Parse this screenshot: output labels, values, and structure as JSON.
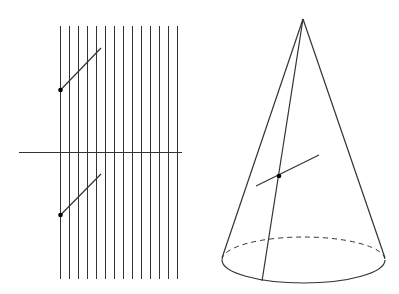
{
  "diagram": {
    "type": "geometry-figure",
    "stroke_color": "#333333",
    "dot_color": "#000000",
    "left_figure": {
      "description": "family of parallel vertical lines crossed by a horizontal line, with two tangent segments marked by points",
      "vertical_lines": {
        "count": 14,
        "x_start": 60,
        "spacing": 9,
        "y_top": 26,
        "y_bottom": 279
      },
      "horizontal_line": {
        "x1": 19,
        "y1": 152,
        "x2": 182,
        "y2": 152
      },
      "segments": [
        {
          "x1": 60,
          "y1": 90,
          "x2": 101,
          "y2": 48,
          "dot": {
            "x": 60,
            "y": 90
          }
        },
        {
          "x1": 60,
          "y1": 215,
          "x2": 101,
          "y2": 174,
          "dot": {
            "x": 60,
            "y": 215
          }
        }
      ]
    },
    "right_figure": {
      "description": "right circular cone with a generatrix, a marked point and a short transversal segment",
      "apex": {
        "x": 303,
        "y": 19
      },
      "base_ellipse": {
        "cx": 303.5,
        "cy": 260,
        "rx": 81.5,
        "ry": 23
      },
      "left_edge_end": {
        "x": 222,
        "y": 258
      },
      "right_edge_end": {
        "x": 385,
        "y": 258
      },
      "generatrix_end": {
        "x": 262,
        "y": 281
      },
      "point": {
        "x": 279,
        "y": 176
      },
      "segment": {
        "x1": 256,
        "y1": 186,
        "x2": 319,
        "y2": 155
      }
    }
  }
}
